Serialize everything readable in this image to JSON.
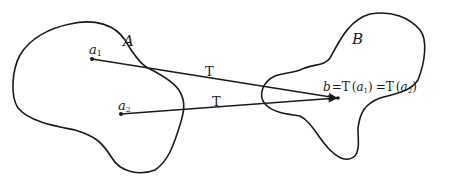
{
  "diagram": {
    "title": "",
    "sets": [
      {
        "id": "A",
        "label": "A"
      },
      {
        "id": "B",
        "label": "B"
      }
    ],
    "points": [
      {
        "id": "a1",
        "base": "a",
        "sub": "1",
        "set": "A"
      },
      {
        "id": "a2",
        "base": "a",
        "sub": "2",
        "set": "A"
      },
      {
        "id": "b",
        "label": "b",
        "set": "B"
      }
    ],
    "mappings": [
      {
        "from": "a1",
        "to": "b",
        "label": "T"
      },
      {
        "from": "a2",
        "to": "b",
        "label": "T"
      }
    ],
    "equation": {
      "lhs": "b",
      "eq1": "=",
      "f1": "T",
      "arg1_base": "a",
      "arg1_sub": "1",
      "eq2": "=",
      "f2": "T",
      "arg2_base": "a",
      "arg2_sub": "2"
    },
    "colors": {
      "ink": "#1a1a1a",
      "background": "#ffffff"
    }
  }
}
